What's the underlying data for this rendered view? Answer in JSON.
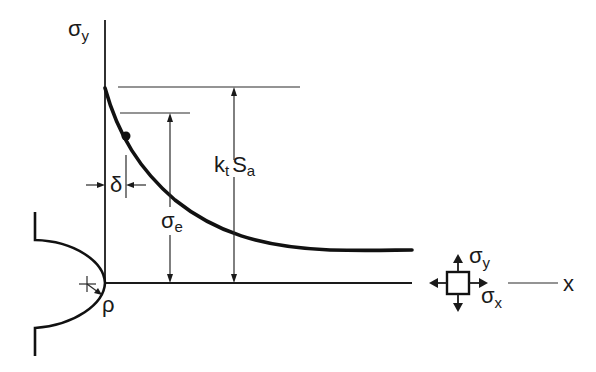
{
  "diagram": {
    "labels": {
      "axis_vertical": {
        "main": "σ",
        "sub": "y"
      },
      "peak_stress": {
        "main": "k",
        "sub": "t",
        "main2": "S",
        "sub2": "a"
      },
      "endurance_stress": {
        "main": "σ",
        "sub": "e"
      },
      "critical_distance": "δ",
      "notch_radius": "ρ",
      "element_sigma_y": {
        "main": "σ",
        "sub": "y"
      },
      "element_sigma_x": {
        "main": "σ",
        "sub": "x"
      },
      "axis_horizontal": "x"
    },
    "colors": {
      "line": "#1a1a1a",
      "background": "#ffffff"
    }
  }
}
